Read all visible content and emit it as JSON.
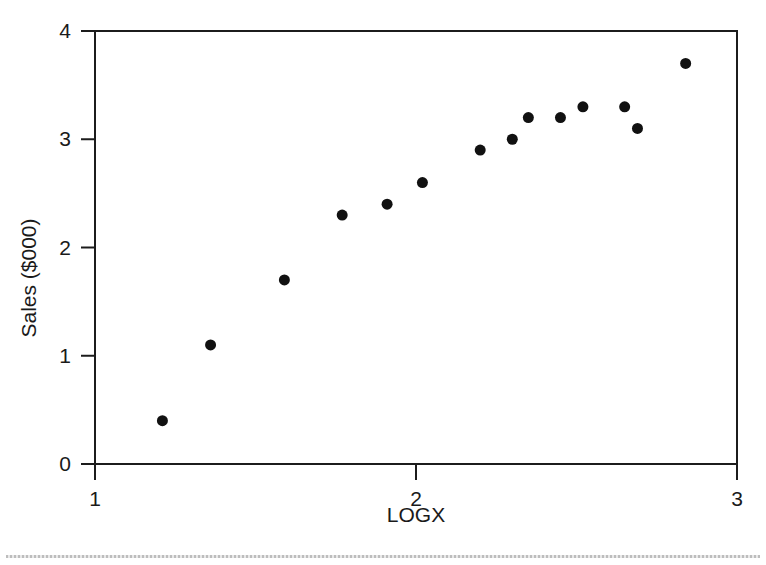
{
  "chart_data": {
    "type": "scatter",
    "title": "",
    "xlabel": "LOGX",
    "ylabel": "Sales ($000)",
    "xlim": [
      1,
      3
    ],
    "ylim": [
      0,
      4
    ],
    "xticks": [
      1,
      2,
      3
    ],
    "xtick_labels": [
      "1",
      "2",
      "3"
    ],
    "yticks": [
      0,
      1,
      2,
      3,
      4
    ],
    "ytick_labels": [
      "0",
      "1",
      "2",
      "3",
      "4"
    ],
    "grid": false,
    "legend": null,
    "marker": {
      "shape": "circle",
      "color": "#111111",
      "size_px": 11
    },
    "series": [
      {
        "name": "Sales",
        "x": [
          1.21,
          1.36,
          1.59,
          1.77,
          1.91,
          2.02,
          2.2,
          2.3,
          2.35,
          2.45,
          2.52,
          2.65,
          2.69,
          2.84
        ],
        "y": [
          0.4,
          1.1,
          1.7,
          2.3,
          2.4,
          2.6,
          2.9,
          3.0,
          3.2,
          3.2,
          3.3,
          3.3,
          3.1,
          3.7
        ]
      }
    ]
  },
  "figure": {
    "frame_color": "#1c1c1c",
    "background": "#ffffff"
  },
  "footer": {
    "rule": "dotted-rule"
  }
}
